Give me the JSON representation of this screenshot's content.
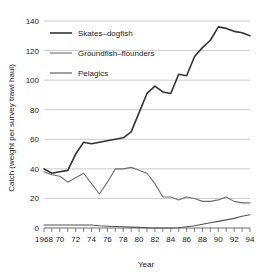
{
  "chart_data": {
    "type": "line",
    "title": "",
    "xlabel": "Year",
    "ylabel": "Catch (weight per survey trawl haul)",
    "xlim": [
      1968,
      1994
    ],
    "ylim": [
      0,
      140
    ],
    "grid": true,
    "legend_position": "top-left",
    "y_ticks": [
      0,
      20,
      40,
      60,
      80,
      100,
      120,
      140
    ],
    "y_tick_labels": [
      "0",
      "20",
      "40",
      "60",
      "80",
      "100",
      "120",
      "140"
    ],
    "x_ticks": [
      1968,
      1969,
      1970,
      1971,
      1972,
      1973,
      1974,
      1975,
      1976,
      1977,
      1978,
      1979,
      1980,
      1981,
      1982,
      1983,
      1984,
      1985,
      1986,
      1987,
      1988,
      1989,
      1990,
      1991,
      1992,
      1993,
      1994
    ],
    "x_tick_labels": [
      "1968",
      "",
      "70",
      "",
      "72",
      "",
      "74",
      "",
      "76",
      "",
      "78",
      "",
      "80",
      "",
      "82",
      "",
      "84",
      "",
      "86",
      "",
      "88",
      "",
      "90",
      "",
      "92",
      "",
      "94"
    ],
    "x": [
      1968,
      1969,
      1970,
      1971,
      1972,
      1973,
      1974,
      1975,
      1976,
      1977,
      1978,
      1979,
      1980,
      1981,
      1982,
      1983,
      1984,
      1985,
      1986,
      1987,
      1988,
      1989,
      1990,
      1991,
      1992,
      1993,
      1994
    ],
    "series": [
      {
        "name": "Skates-dogfish",
        "color": "#333333",
        "width": 1.6,
        "values": [
          40,
          37,
          38,
          39,
          50,
          58,
          57,
          58,
          59,
          60,
          61,
          65,
          78,
          91,
          96,
          92,
          91,
          104,
          103,
          116,
          122,
          127,
          136,
          135,
          133,
          132,
          130
        ]
      },
      {
        "name": "Groundfish-flounders",
        "color": "#6e6e6e",
        "width": 1.1,
        "values": [
          38,
          36,
          35,
          31,
          34,
          37,
          30,
          23,
          31,
          40,
          40,
          41,
          39,
          37,
          30,
          21,
          21,
          19,
          21,
          20,
          18,
          18,
          19,
          21,
          18,
          17,
          17
        ]
      },
      {
        "name": "Pelagics",
        "color": "#555555",
        "width": 1.1,
        "values": [
          2,
          2,
          2,
          2,
          2,
          2,
          2,
          1.5,
          1.2,
          1,
          0.8,
          0.6,
          0.4,
          0.2,
          0,
          0,
          0,
          0.2,
          0.8,
          1.5,
          2.5,
          3.5,
          4.5,
          5.5,
          6.5,
          8,
          9
        ]
      }
    ]
  },
  "legend": {
    "entries": [
      {
        "label": "Skates–dogfish"
      },
      {
        "label": "Groundfish–flounders"
      },
      {
        "label": "Pelagics"
      }
    ]
  },
  "axes": {
    "x_title": "Year",
    "y_title": "Catch (weight per survey trawl haul)"
  }
}
